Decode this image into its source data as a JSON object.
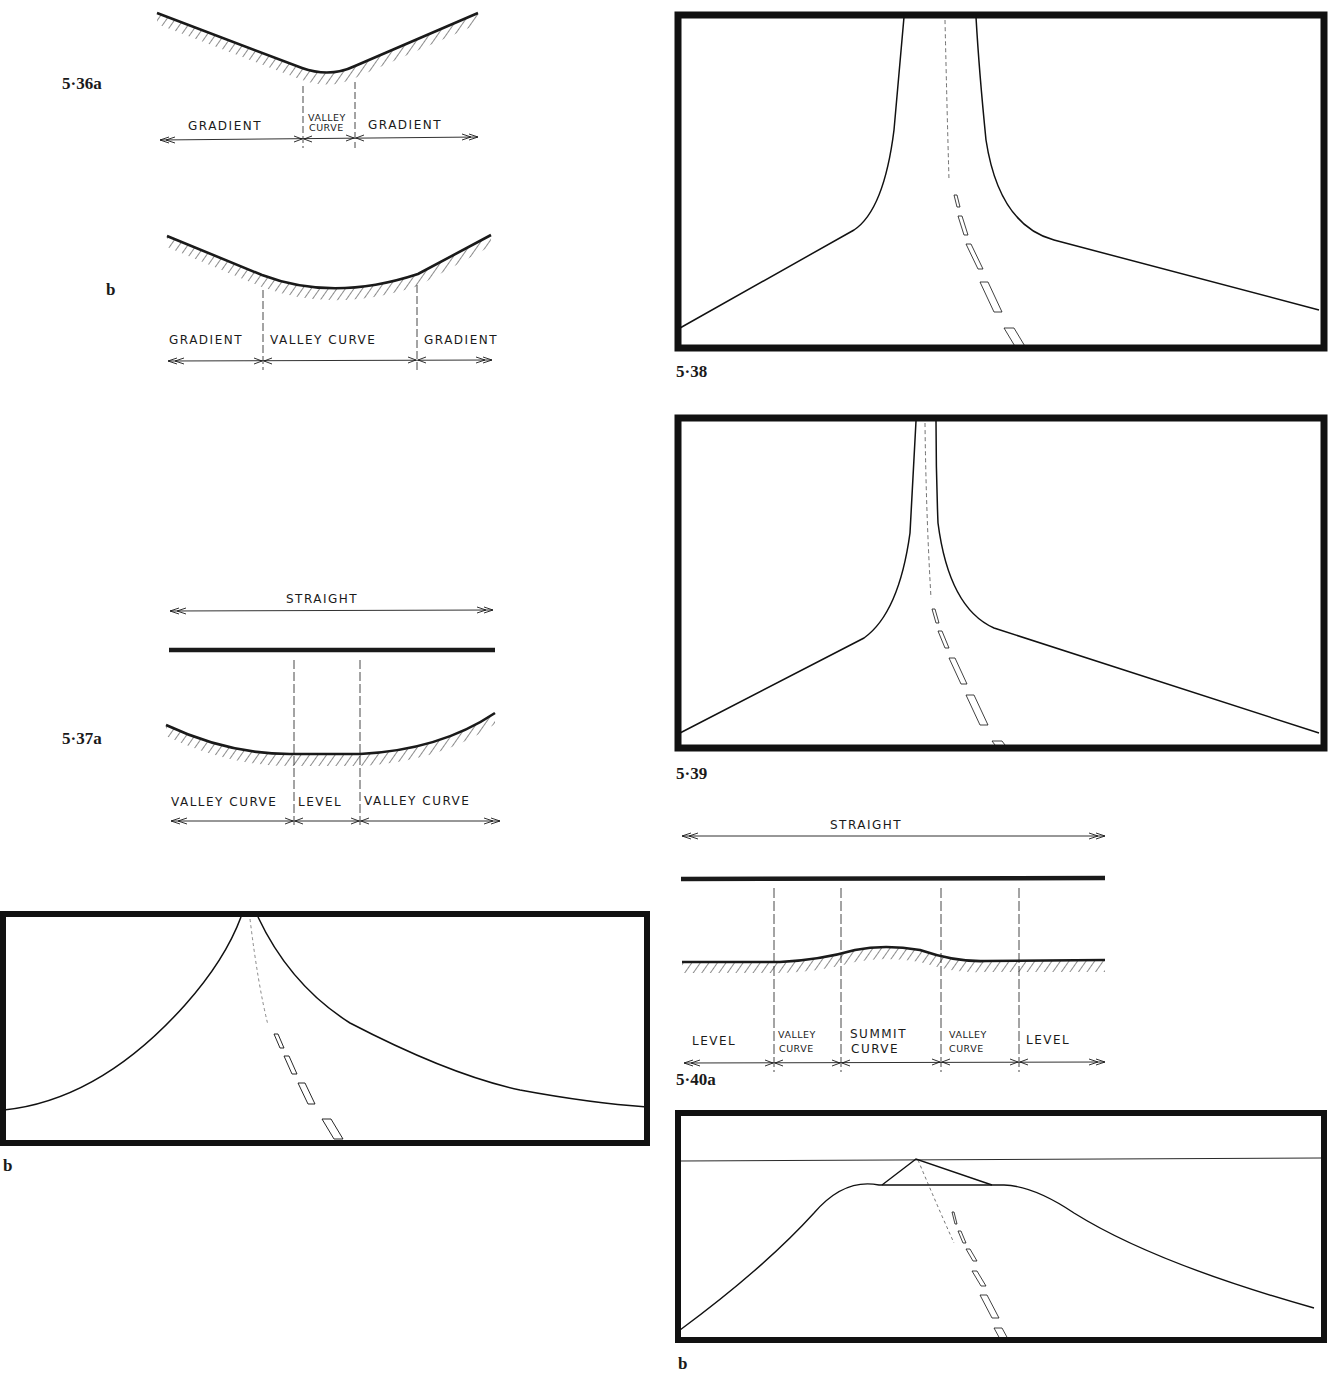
{
  "page": {
    "background": "#ffffff",
    "ink_color": "#1a1a1a"
  },
  "figures": {
    "fig_5_36a": {
      "label": "5·36a",
      "segments": [
        "GRADIENT",
        "VALLEY",
        "CURVE",
        "GRADIENT"
      ]
    },
    "fig_5_36b": {
      "label": "b",
      "segments": [
        "GRADIENT",
        "VALLEY CURVE",
        "GRADIENT"
      ]
    },
    "fig_5_37a": {
      "label": "5·37a",
      "top_label": "STRAIGHT",
      "segments": [
        "VALLEY CURVE",
        "LEVEL",
        "VALLEY CURVE"
      ]
    },
    "fig_5_37b": {
      "label": "b"
    },
    "fig_5_38": {
      "label": "5·38"
    },
    "fig_5_39": {
      "label": "5·39"
    },
    "fig_5_40a": {
      "label": "5·40a",
      "top_label": "STRAIGHT",
      "segments": [
        "LEVEL",
        "VALLEY",
        "CURVE",
        "SUMMIT",
        "CURVE",
        "VALLEY",
        "CURVE",
        "LEVEL"
      ]
    },
    "fig_5_40b": {
      "label": "b"
    }
  }
}
